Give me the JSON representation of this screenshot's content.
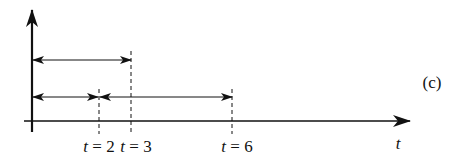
{
  "figure": {
    "panel_label": "(c)",
    "x_axis_label": "t",
    "markers": [
      {
        "var": "t",
        "eq": " = ",
        "value": "2"
      },
      {
        "var": "t",
        "eq": " = ",
        "value": "3"
      },
      {
        "var": "t",
        "eq": " = ",
        "value": "6"
      }
    ],
    "intervals": [
      {
        "name": "upper",
        "from": 0,
        "to": 3
      },
      {
        "name": "lower-left",
        "from": 0,
        "to": 2
      },
      {
        "name": "lower-right",
        "from": 2,
        "to": 6
      }
    ],
    "colors": {
      "ink": "#111111",
      "background": "#ffffff"
    }
  }
}
